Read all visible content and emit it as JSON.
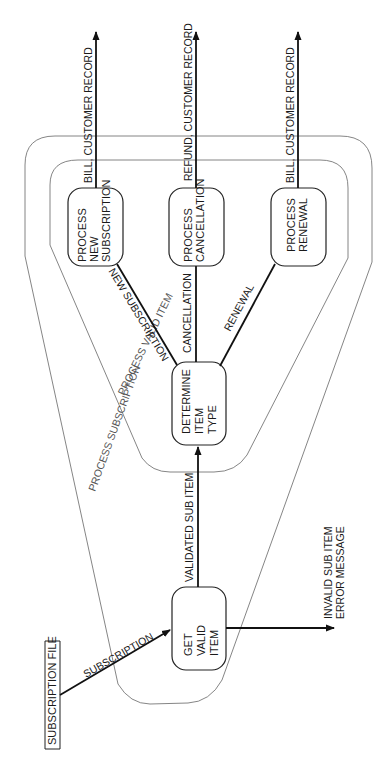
{
  "diagram": {
    "orientation": "rotated-90-ccw",
    "external_entities": [
      {
        "id": "subscription-file",
        "label": "SUBSCRIPTION FILE"
      }
    ],
    "boundaries": [
      {
        "id": "process-subscription",
        "label": "PROCESS SUBSCRIPTION"
      },
      {
        "id": "process-valid-item",
        "label": "PROCESS VALID ITEM"
      }
    ],
    "processes": [
      {
        "id": "get-valid-item",
        "lines": [
          "GET",
          "VALID",
          "ITEM"
        ]
      },
      {
        "id": "determine-item-type",
        "lines": [
          "DETERMINE",
          "ITEM",
          "TYPE"
        ]
      },
      {
        "id": "process-new-subscription",
        "lines": [
          "PROCESS",
          "NEW",
          "SUBSCRIPTION"
        ]
      },
      {
        "id": "process-cancellation",
        "lines": [
          "PROCESS",
          "CANCELLATION"
        ]
      },
      {
        "id": "process-renewal",
        "lines": [
          "PROCESS",
          "RENEWAL"
        ]
      }
    ],
    "flows": {
      "subscription": "SUBSCRIPTION",
      "validated_sub_item": "VALIDATED SUB ITEM",
      "invalid_line1": "INVALID SUB ITEM",
      "invalid_line2": "ERROR MESSAGE",
      "new_subscription": "NEW SUBSCRIPTION",
      "cancellation": "CANCELLATION",
      "renewal": "RENEWAL",
      "out_new": "BILL, CUSTOMER RECORD",
      "out_cancel": "REFUND, CUSTOMER RECORD",
      "out_renewal": "BILL, CUSTOMER RECORD"
    }
  }
}
